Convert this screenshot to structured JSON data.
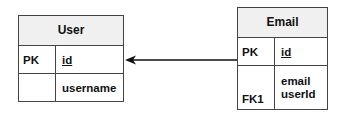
{
  "diagram": {
    "type": "entity-relationship",
    "entities": [
      {
        "name": "User",
        "rows": [
          {
            "key": "PK",
            "attributes": [
              "id"
            ],
            "underlined": true
          },
          {
            "key": "",
            "attributes": [
              "username"
            ],
            "underlined": false
          }
        ]
      },
      {
        "name": "Email",
        "rows": [
          {
            "key": "PK",
            "attributes": [
              "id"
            ],
            "underlined": true
          },
          {
            "key": "FK1",
            "attributes": [
              "email",
              "userId"
            ],
            "underlined": false
          }
        ]
      }
    ],
    "relationships": [
      {
        "from": "Email.userId",
        "to": "User.id",
        "style": "arrow"
      }
    ],
    "colors": {
      "border": "#444444",
      "header_bg": "#f0f0f0",
      "line": "#111111"
    }
  }
}
